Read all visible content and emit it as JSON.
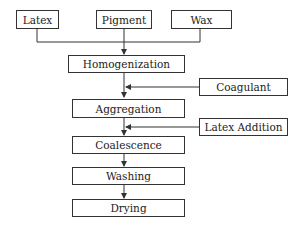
{
  "diagram": {
    "type": "flowchart",
    "inputs": [
      {
        "id": "latex",
        "label": "Latex"
      },
      {
        "id": "pigment",
        "label": "Pigment"
      },
      {
        "id": "wax",
        "label": "Wax"
      }
    ],
    "steps": [
      {
        "id": "homogenization",
        "label": "Homogenization"
      },
      {
        "id": "aggregation",
        "label": "Aggregation"
      },
      {
        "id": "coalescence",
        "label": "Coalescence"
      },
      {
        "id": "washing",
        "label": "Washing"
      },
      {
        "id": "drying",
        "label": "Drying"
      }
    ],
    "side_inputs": [
      {
        "id": "coagulant",
        "label": "Coagulant",
        "joins_between": [
          "homogenization",
          "aggregation"
        ]
      },
      {
        "id": "latex_addition",
        "label": "Latex Addition",
        "joins_between": [
          "aggregation",
          "coalescence"
        ]
      }
    ],
    "colors": {
      "line": "#333333",
      "box_border": "#333333",
      "background": "#ffffff"
    }
  }
}
